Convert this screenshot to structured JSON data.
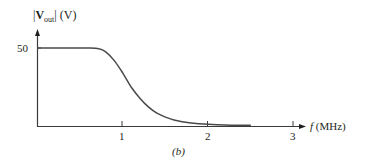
{
  "chart_data": {
    "type": "line",
    "title": "",
    "subtitle": "",
    "caption": "(b)",
    "xlabel": "f (MHz)",
    "ylabel": "|Vout| (V)",
    "x_ticks": [
      1,
      2,
      3
    ],
    "y_ticks": [
      50
    ],
    "xlim": [
      0,
      3.2
    ],
    "ylim": [
      0,
      60
    ],
    "grid": false,
    "legend": null,
    "series": [
      {
        "name": "|Vout|",
        "x": [
          0,
          0.2,
          0.4,
          0.6,
          0.72,
          0.8,
          0.9,
          1.0,
          1.1,
          1.2,
          1.3,
          1.4,
          1.5,
          1.6,
          1.8,
          2.0,
          2.2,
          2.5
        ],
        "y": [
          50,
          50,
          50,
          50,
          49.5,
          47.5,
          42,
          34,
          25,
          18,
          12.5,
          8.5,
          6,
          4.2,
          2.3,
          1.4,
          1.0,
          0.8
        ]
      }
    ],
    "color": "#4a4a4a"
  },
  "labels": {
    "y_axis_bars": "|",
    "y_axis_main": "V",
    "y_axis_sub": "out",
    "y_axis_unit": "(V)",
    "x_axis_var": "f",
    "x_axis_unit": "(MHz)",
    "y_tick_50": "50",
    "x_tick_1": "1",
    "x_tick_2": "2",
    "x_tick_3": "3",
    "caption": "(b)"
  }
}
